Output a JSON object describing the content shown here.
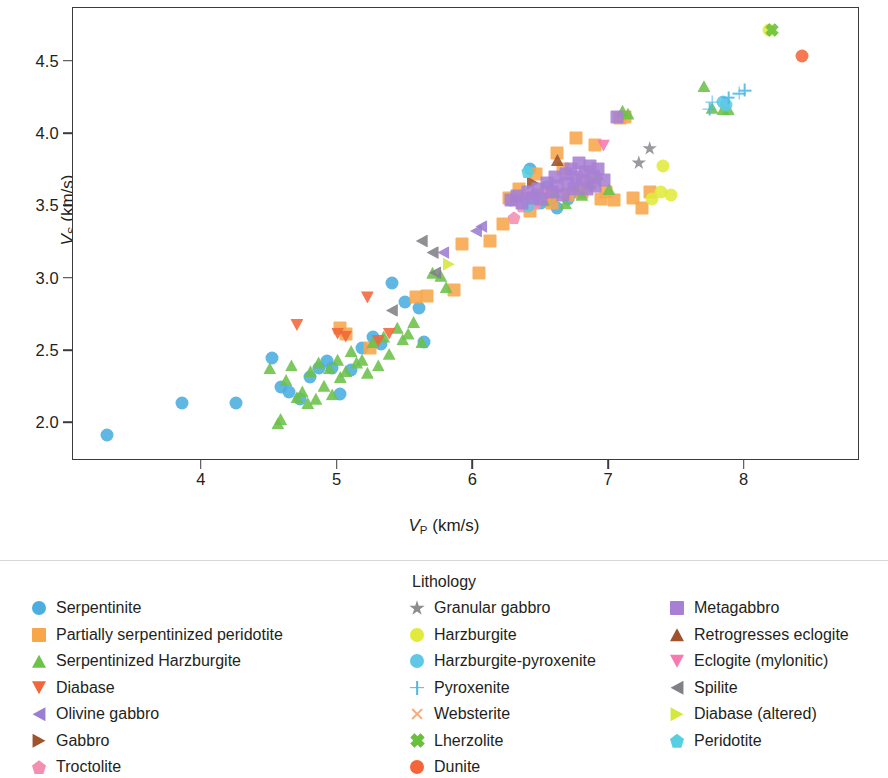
{
  "chart_data": {
    "type": "scatter",
    "title": "",
    "xlabel": "VP (km/s)",
    "ylabel": "VS (km/s)",
    "xlabel_parts": {
      "v": "V",
      "sub": "P",
      "unit": " (km/s)"
    },
    "ylabel_parts": {
      "v": "V",
      "sub": "S",
      "unit": " (km/s)"
    },
    "xlim": [
      3.05,
      8.85
    ],
    "ylim": [
      1.74,
      4.87
    ],
    "xticks": [
      4,
      5,
      6,
      7,
      8
    ],
    "xtick_labels": [
      "4",
      "5",
      "6",
      "7",
      "8"
    ],
    "yticks": [
      2.0,
      2.5,
      3.0,
      3.5,
      4.0,
      4.5
    ],
    "ytick_labels": [
      "2.0",
      "2.5",
      "3.0",
      "3.5",
      "4.0",
      "4.5"
    ],
    "grid": false,
    "legend_position": "below",
    "legend_title": "Lithology",
    "series": [
      {
        "name": "Serpentinite",
        "marker": "circle",
        "color": "#4bade0",
        "points": [
          [
            3.3,
            1.92
          ],
          [
            3.85,
            2.14
          ],
          [
            4.25,
            2.14
          ],
          [
            4.52,
            2.45
          ],
          [
            4.58,
            2.25
          ],
          [
            4.64,
            2.22
          ],
          [
            4.72,
            2.17
          ],
          [
            4.8,
            2.32
          ],
          [
            4.86,
            2.38
          ],
          [
            4.92,
            2.43
          ],
          [
            4.96,
            2.38
          ],
          [
            5.02,
            2.2
          ],
          [
            5.1,
            2.37
          ],
          [
            5.18,
            2.52
          ],
          [
            5.26,
            2.6
          ],
          [
            5.32,
            2.55
          ],
          [
            5.4,
            2.97
          ],
          [
            5.5,
            2.84
          ],
          [
            5.6,
            2.8
          ],
          [
            5.64,
            2.56
          ],
          [
            6.28,
            3.54
          ],
          [
            6.36,
            3.56
          ],
          [
            6.42,
            3.76
          ],
          [
            6.46,
            3.58
          ],
          [
            6.5,
            3.52
          ],
          [
            6.54,
            3.63
          ],
          [
            6.58,
            3.55
          ],
          [
            6.62,
            3.49
          ],
          [
            6.7,
            3.55
          ],
          [
            6.74,
            3.6
          ]
        ]
      },
      {
        "name": "Partially serpentinized peridotite",
        "marker": "square",
        "color": "#f7a64a",
        "points": [
          [
            5.02,
            2.66
          ],
          [
            5.06,
            2.62
          ],
          [
            5.24,
            2.52
          ],
          [
            5.58,
            2.87
          ],
          [
            5.66,
            2.88
          ],
          [
            5.86,
            2.92
          ],
          [
            5.92,
            3.24
          ],
          [
            6.04,
            3.04
          ],
          [
            6.12,
            3.26
          ],
          [
            6.22,
            3.38
          ],
          [
            6.26,
            3.56
          ],
          [
            6.34,
            3.62
          ],
          [
            6.42,
            3.47
          ],
          [
            6.46,
            3.72
          ],
          [
            6.52,
            3.58
          ],
          [
            6.58,
            3.52
          ],
          [
            6.62,
            3.87
          ],
          [
            6.66,
            3.76
          ],
          [
            6.7,
            3.58
          ],
          [
            6.76,
            3.97
          ],
          [
            6.8,
            3.6
          ],
          [
            6.86,
            3.66
          ],
          [
            6.9,
            3.92
          ],
          [
            6.94,
            3.55
          ],
          [
            6.98,
            3.6
          ],
          [
            7.04,
            3.54
          ],
          [
            7.08,
            4.11
          ],
          [
            7.12,
            4.12
          ],
          [
            7.18,
            3.56
          ],
          [
            7.24,
            3.49
          ],
          [
            7.3,
            3.6
          ]
        ]
      },
      {
        "name": "Serpentinized Harzburgite",
        "marker": "tri-up",
        "color": "#6cc24a",
        "points": [
          [
            4.5,
            2.38
          ],
          [
            4.56,
            2.0
          ],
          [
            4.58,
            2.03
          ],
          [
            4.62,
            2.3
          ],
          [
            4.66,
            2.4
          ],
          [
            4.7,
            2.18
          ],
          [
            4.74,
            2.22
          ],
          [
            4.78,
            2.14
          ],
          [
            4.8,
            2.36
          ],
          [
            4.84,
            2.17
          ],
          [
            4.86,
            2.42
          ],
          [
            4.9,
            2.26
          ],
          [
            4.94,
            2.38
          ],
          [
            4.96,
            2.2
          ],
          [
            5.0,
            2.44
          ],
          [
            5.02,
            2.32
          ],
          [
            5.06,
            2.36
          ],
          [
            5.1,
            2.5
          ],
          [
            5.14,
            2.42
          ],
          [
            5.18,
            2.44
          ],
          [
            5.22,
            2.35
          ],
          [
            5.26,
            2.56
          ],
          [
            5.3,
            2.4
          ],
          [
            5.34,
            2.6
          ],
          [
            5.38,
            2.48
          ],
          [
            5.44,
            2.66
          ],
          [
            5.48,
            2.58
          ],
          [
            5.52,
            2.62
          ],
          [
            5.56,
            2.7
          ],
          [
            5.62,
            2.56
          ],
          [
            5.7,
            3.04
          ],
          [
            5.76,
            3.02
          ],
          [
            5.8,
            2.94
          ],
          [
            6.52,
            3.54
          ],
          [
            6.6,
            3.6
          ],
          [
            6.68,
            3.52
          ],
          [
            6.74,
            3.64
          ],
          [
            6.8,
            3.58
          ],
          [
            6.86,
            3.66
          ],
          [
            6.92,
            3.72
          ],
          [
            7.0,
            3.62
          ],
          [
            7.1,
            4.16
          ],
          [
            7.14,
            4.14
          ],
          [
            7.7,
            4.33
          ],
          [
            7.76,
            4.18
          ],
          [
            7.84,
            4.17
          ],
          [
            7.88,
            4.17
          ]
        ]
      },
      {
        "name": "Diabase",
        "marker": "tri-down",
        "color": "#f4663a",
        "points": [
          [
            4.7,
            2.68
          ],
          [
            5.0,
            2.62
          ],
          [
            5.06,
            2.6
          ],
          [
            5.22,
            2.87
          ],
          [
            5.3,
            2.57
          ],
          [
            5.38,
            2.62
          ]
        ]
      },
      {
        "name": "Olivine gabbro",
        "marker": "tri-left",
        "color": "#9b7ed0",
        "points": [
          [
            5.78,
            3.18
          ],
          [
            6.02,
            3.33
          ],
          [
            6.06,
            3.36
          ]
        ]
      },
      {
        "name": "Gabbro",
        "marker": "tri-right",
        "color": "#a0522d",
        "points": [
          [
            6.44,
            3.66
          ]
        ]
      },
      {
        "name": "Troctolite",
        "marker": "pent",
        "color": "#f48fb1",
        "points": [
          [
            6.3,
            3.42
          ],
          [
            6.36,
            3.5
          ],
          [
            6.4,
            3.56
          ],
          [
            6.46,
            3.52
          ],
          [
            6.52,
            3.58
          ]
        ]
      },
      {
        "name": "Granular gabbro",
        "marker": "star",
        "color": "#8c8c93",
        "points": [
          [
            7.22,
            3.8
          ],
          [
            7.3,
            3.9
          ]
        ]
      },
      {
        "name": "Harzburgite",
        "marker": "circle",
        "color": "#e0eb3c",
        "points": [
          [
            7.32,
            3.55
          ],
          [
            7.38,
            3.6
          ],
          [
            7.4,
            3.78
          ],
          [
            7.46,
            3.58
          ],
          [
            8.18,
            4.72
          ]
        ]
      },
      {
        "name": "Harzburgite-pyroxenite",
        "marker": "circle",
        "color": "#5ec8e5",
        "points": [
          [
            6.4,
            3.5
          ],
          [
            6.46,
            3.56
          ],
          [
            7.84,
            4.22
          ],
          [
            7.86,
            4.2
          ]
        ]
      },
      {
        "name": "Pyroxenite",
        "marker": "plus",
        "color": "#4bb8e8",
        "points": [
          [
            7.74,
            4.17
          ],
          [
            7.76,
            4.22
          ],
          [
            7.96,
            4.28
          ],
          [
            8.0,
            4.3
          ],
          [
            7.88,
            4.25
          ]
        ]
      },
      {
        "name": "Websterite",
        "marker": "xmark",
        "color": "#f9a97a",
        "points": [
          [
            6.7,
            3.6
          ]
        ]
      },
      {
        "name": "Lherzolite",
        "marker": "xcross",
        "color": "#67c23a",
        "points": [
          [
            8.2,
            4.72
          ]
        ]
      },
      {
        "name": "Dunite",
        "marker": "circle",
        "color": "#f4663a",
        "points": [
          [
            8.42,
            4.54
          ]
        ]
      },
      {
        "name": "Metagabbro",
        "marker": "square",
        "color": "#a77fd4",
        "points": [
          [
            6.28,
            3.54
          ],
          [
            6.32,
            3.57
          ],
          [
            6.36,
            3.52
          ],
          [
            6.4,
            3.6
          ],
          [
            6.44,
            3.56
          ],
          [
            6.48,
            3.62
          ],
          [
            6.5,
            3.55
          ],
          [
            6.54,
            3.66
          ],
          [
            6.58,
            3.6
          ],
          [
            6.6,
            3.7
          ],
          [
            6.62,
            3.64
          ],
          [
            6.66,
            3.58
          ],
          [
            6.68,
            3.72
          ],
          [
            6.7,
            3.66
          ],
          [
            6.72,
            3.76
          ],
          [
            6.74,
            3.62
          ],
          [
            6.76,
            3.7
          ],
          [
            6.78,
            3.8
          ],
          [
            6.8,
            3.68
          ],
          [
            6.82,
            3.74
          ],
          [
            6.84,
            3.62
          ],
          [
            6.86,
            3.78
          ],
          [
            6.88,
            3.7
          ],
          [
            6.9,
            3.64
          ],
          [
            6.92,
            3.76
          ],
          [
            6.96,
            3.68
          ],
          [
            7.06,
            4.12
          ]
        ]
      },
      {
        "name": "Retrogresses eclogite",
        "marker": "tri-up",
        "color": "#a0522d",
        "points": [
          [
            6.62,
            3.82
          ]
        ]
      },
      {
        "name": "Eclogite (mylonitic)",
        "marker": "tri-down",
        "color": "#f878b0",
        "points": [
          [
            6.96,
            3.92
          ]
        ]
      },
      {
        "name": "Spilite",
        "marker": "tri-left",
        "color": "#808086",
        "points": [
          [
            5.4,
            2.78
          ],
          [
            5.62,
            3.26
          ],
          [
            5.7,
            3.18
          ],
          [
            5.72,
            3.04
          ]
        ]
      },
      {
        "name": "Diabase (altered)",
        "marker": "tri-right",
        "color": "#d4e83c",
        "points": [
          [
            5.82,
            3.1
          ]
        ]
      },
      {
        "name": "Peridotite",
        "marker": "pent",
        "color": "#56cfe1",
        "points": [
          [
            6.4,
            3.74
          ]
        ]
      }
    ]
  },
  "legend": {
    "title": "Lithology",
    "columns": [
      {
        "items": [
          {
            "label": "Serpentinite",
            "marker": "circle",
            "color": "#4bade0"
          },
          {
            "label": "Partially serpentinized peridotite",
            "marker": "square",
            "color": "#f7a64a"
          },
          {
            "label": "Serpentinized Harzburgite",
            "marker": "tri-up",
            "color": "#6cc24a"
          },
          {
            "label": "Diabase",
            "marker": "tri-down",
            "color": "#f4663a"
          },
          {
            "label": "Olivine gabbro",
            "marker": "tri-left",
            "color": "#9b7ed0"
          },
          {
            "label": "Gabbro",
            "marker": "tri-right",
            "color": "#a0522d"
          },
          {
            "label": "Troctolite",
            "marker": "pent",
            "color": "#f48fb1"
          }
        ]
      },
      {
        "items": [
          {
            "label": "Granular gabbro",
            "marker": "star",
            "color": "#8c8c93"
          },
          {
            "label": "Harzburgite",
            "marker": "circle",
            "color": "#e0eb3c"
          },
          {
            "label": "Harzburgite-pyroxenite",
            "marker": "circle",
            "color": "#5ec8e5"
          },
          {
            "label": "Pyroxenite",
            "marker": "plus",
            "color": "#4bb8e8"
          },
          {
            "label": "Websterite",
            "marker": "xmark",
            "color": "#f9a97a"
          },
          {
            "label": "Lherzolite",
            "marker": "xcross",
            "color": "#67c23a"
          },
          {
            "label": "Dunite",
            "marker": "circle",
            "color": "#f4663a"
          }
        ]
      },
      {
        "items": [
          {
            "label": "Metagabbro",
            "marker": "square",
            "color": "#a77fd4"
          },
          {
            "label": "Retrogresses eclogite",
            "marker": "tri-up",
            "color": "#a0522d"
          },
          {
            "label": "Eclogite (mylonitic)",
            "marker": "tri-down",
            "color": "#f878b0"
          },
          {
            "label": "Spilite",
            "marker": "tri-left",
            "color": "#808086"
          },
          {
            "label": "Diabase (altered)",
            "marker": "tri-right",
            "color": "#d4e83c"
          },
          {
            "label": "Peridotite",
            "marker": "pent",
            "color": "#56cfe1"
          }
        ]
      }
    ]
  }
}
